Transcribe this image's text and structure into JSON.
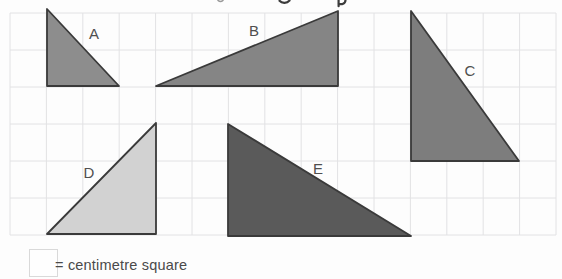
{
  "figure": {
    "background": "#fdfdfd",
    "grid": {
      "origin_x": 10,
      "origin_y": 13,
      "cols": 15,
      "rows": 6,
      "cell_width": 36.4,
      "cell_height": 37,
      "line_color": "#e2e2e4",
      "unit_label": "centimetre square"
    },
    "triangles": [
      {
        "label": "A",
        "fill": "#8d8d8d",
        "outline": "#3a3a3a",
        "vertices": [
          [
            47,
            9
          ],
          [
            47,
            86
          ],
          [
            119,
            86
          ]
        ],
        "base_cm": 2,
        "height_cm": 2,
        "label_x": 94,
        "label_y": 39
      },
      {
        "label": "B",
        "fill": "#858585",
        "outline": "#3a3a3a",
        "vertices": [
          [
            156,
            86
          ],
          [
            338,
            11
          ],
          [
            338,
            86
          ]
        ],
        "base_cm": 5,
        "height_cm": 2,
        "label_x": 254,
        "label_y": 36
      },
      {
        "label": "C",
        "fill": "#7d7d7d",
        "outline": "#3a3a3a",
        "vertices": [
          [
            411,
            11
          ],
          [
            411,
            161
          ],
          [
            519,
            161
          ]
        ],
        "base_cm": 3,
        "height_cm": 4,
        "label_x": 470,
        "label_y": 76
      },
      {
        "label": "D",
        "fill": "#d2d2d2",
        "outline": "#3a3a3a",
        "vertices": [
          [
            156,
            123
          ],
          [
            156,
            234
          ],
          [
            47,
            234
          ]
        ],
        "base_cm": 3,
        "height_cm": 3,
        "label_x": 89,
        "label_y": 178
      },
      {
        "label": "E",
        "fill": "#5a5a5a",
        "outline": "#3a3a3a",
        "vertices": [
          [
            228,
            124
          ],
          [
            228,
            236
          ],
          [
            411,
            236
          ]
        ],
        "base_cm": 5,
        "height_cm": 3,
        "label_x": 318,
        "label_y": 174
      }
    ],
    "legend": {
      "text": "= centimetre square"
    }
  }
}
